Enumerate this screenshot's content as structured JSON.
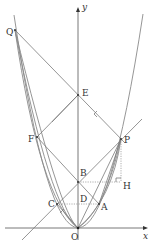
{
  "diagram": {
    "axes": {
      "x_label": "x",
      "y_label": "y",
      "origin_label": "O"
    },
    "points": {
      "Q": "Q",
      "E": "E",
      "F": "F",
      "P": "P",
      "B": "B",
      "H": "H",
      "C": "C",
      "D": "D",
      "A": "A"
    },
    "colors": {
      "line": "#7a7a7a",
      "text": "#333333"
    }
  }
}
